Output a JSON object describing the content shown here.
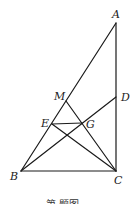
{
  "diagram": {
    "type": "geometry-figure",
    "points": [
      {
        "name": "A",
        "x": 116,
        "y": 23,
        "label_x": 113,
        "label_y": 18
      },
      {
        "name": "D",
        "x": 116,
        "y": 97,
        "label_x": 121,
        "label_y": 101
      },
      {
        "name": "C",
        "x": 116,
        "y": 171,
        "label_x": 114,
        "label_y": 184
      },
      {
        "name": "B",
        "x": 21,
        "y": 171,
        "label_x": 10,
        "label_y": 180
      },
      {
        "name": "M",
        "x": 66,
        "y": 101,
        "label_x": 55,
        "label_y": 100
      },
      {
        "name": "E",
        "x": 52,
        "y": 124,
        "label_x": 41,
        "label_y": 127
      },
      {
        "name": "G",
        "x": 82,
        "y": 123,
        "label_x": 86,
        "label_y": 128
      }
    ],
    "segments": [
      {
        "from": "A",
        "to": "B"
      },
      {
        "from": "A",
        "to": "C"
      },
      {
        "from": "B",
        "to": "C"
      },
      {
        "from": "B",
        "to": "D"
      },
      {
        "from": "M",
        "to": "C"
      },
      {
        "from": "E",
        "to": "C"
      },
      {
        "from": "E",
        "to": "G"
      }
    ],
    "labels": {
      "A": "A",
      "B": "B",
      "C": "C",
      "D": "D",
      "E": "E",
      "G": "G",
      "M": "M"
    },
    "caption": "第 题图"
  }
}
